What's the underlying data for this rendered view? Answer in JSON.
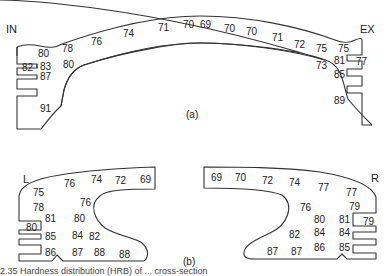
{
  "figure_a": {
    "label": "(a)",
    "side_left": "IN",
    "side_right": "EX",
    "values": [
      {
        "v": "80",
        "x": 38,
        "y": 57
      },
      {
        "v": "78",
        "x": 62,
        "y": 52
      },
      {
        "v": "76",
        "x": 91,
        "y": 45
      },
      {
        "v": "74",
        "x": 123,
        "y": 37
      },
      {
        "v": "71",
        "x": 158,
        "y": 31
      },
      {
        "v": "70",
        "x": 183,
        "y": 28
      },
      {
        "v": "69",
        "x": 200,
        "y": 28
      },
      {
        "v": "70",
        "x": 224,
        "y": 32
      },
      {
        "v": "70",
        "x": 246,
        "y": 35
      },
      {
        "v": "71",
        "x": 272,
        "y": 41
      },
      {
        "v": "72",
        "x": 294,
        "y": 48
      },
      {
        "v": "75",
        "x": 316,
        "y": 52
      },
      {
        "v": "75",
        "x": 338,
        "y": 52
      },
      {
        "v": "82",
        "x": 22,
        "y": 71
      },
      {
        "v": "83",
        "x": 40,
        "y": 70
      },
      {
        "v": "87",
        "x": 40,
        "y": 80
      },
      {
        "v": "80",
        "x": 63,
        "y": 68
      },
      {
        "v": "91",
        "x": 40,
        "y": 112
      },
      {
        "v": "73",
        "x": 316,
        "y": 69
      },
      {
        "v": "81",
        "x": 334,
        "y": 64
      },
      {
        "v": "77",
        "x": 356,
        "y": 65
      },
      {
        "v": "85",
        "x": 334,
        "y": 78
      },
      {
        "v": "89",
        "x": 334,
        "y": 104
      }
    ]
  },
  "figure_b": {
    "label": "(b)",
    "side_left": "L",
    "side_right": "R",
    "values": [
      {
        "v": "75",
        "x": 33,
        "y": 196
      },
      {
        "v": "78",
        "x": 33,
        "y": 211
      },
      {
        "v": "76",
        "x": 64,
        "y": 187
      },
      {
        "v": "74",
        "x": 91,
        "y": 183
      },
      {
        "v": "72",
        "x": 115,
        "y": 184
      },
      {
        "v": "69",
        "x": 140,
        "y": 183
      },
      {
        "v": "76",
        "x": 80,
        "y": 206
      },
      {
        "v": "81",
        "x": 45,
        "y": 222
      },
      {
        "v": "80",
        "x": 74,
        "y": 222
      },
      {
        "v": "80",
        "x": 26,
        "y": 231
      },
      {
        "v": "85",
        "x": 45,
        "y": 240
      },
      {
        "v": "84",
        "x": 72,
        "y": 239
      },
      {
        "v": "82",
        "x": 89,
        "y": 240
      },
      {
        "v": "86",
        "x": 45,
        "y": 256
      },
      {
        "v": "87",
        "x": 72,
        "y": 256
      },
      {
        "v": "88",
        "x": 94,
        "y": 256
      },
      {
        "v": "88",
        "x": 119,
        "y": 258
      },
      {
        "v": "69",
        "x": 211,
        "y": 181
      },
      {
        "v": "70",
        "x": 235,
        "y": 181
      },
      {
        "v": "72",
        "x": 262,
        "y": 184
      },
      {
        "v": "74",
        "x": 289,
        "y": 186
      },
      {
        "v": "77",
        "x": 318,
        "y": 191
      },
      {
        "v": "77",
        "x": 346,
        "y": 196
      },
      {
        "v": "76",
        "x": 300,
        "y": 211
      },
      {
        "v": "79",
        "x": 349,
        "y": 210
      },
      {
        "v": "80",
        "x": 314,
        "y": 223
      },
      {
        "v": "81",
        "x": 339,
        "y": 223
      },
      {
        "v": "79",
        "x": 363,
        "y": 225
      },
      {
        "v": "82",
        "x": 289,
        "y": 238
      },
      {
        "v": "84",
        "x": 314,
        "y": 236
      },
      {
        "v": "84",
        "x": 339,
        "y": 236
      },
      {
        "v": "87",
        "x": 267,
        "y": 255
      },
      {
        "v": "87",
        "x": 291,
        "y": 255
      },
      {
        "v": "86",
        "x": 314,
        "y": 251
      },
      {
        "v": "85",
        "x": 339,
        "y": 251
      }
    ]
  },
  "caption": "2.35 Hardness distribution (HRB) of ... cross-section"
}
